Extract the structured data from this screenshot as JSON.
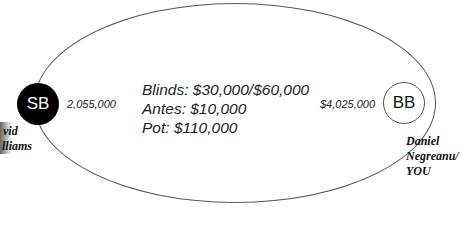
{
  "table": {
    "blinds": "Blinds: $30,000/$60,000",
    "antes": "Antes: $10,000",
    "pot": "Pot: $110,000"
  },
  "seats": {
    "sb": {
      "label": "SB",
      "stack": "2,055,000",
      "name_line1": "vid",
      "name_line2": "lliams"
    },
    "bb": {
      "label": "BB",
      "stack": "$4,025,000",
      "name_line1": "Daniel",
      "name_line2": "Negreanu/",
      "name_line3": "YOU"
    }
  }
}
